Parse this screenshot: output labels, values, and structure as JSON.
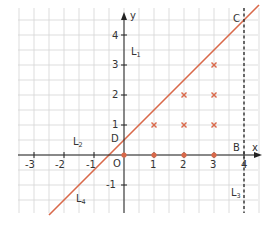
{
  "diagram": {
    "title": "",
    "axes": {
      "x_label": "x",
      "y_label": "y",
      "origin_label": "O",
      "x_ticks": [
        "-3",
        "-2",
        "-1",
        "1",
        "2",
        "3",
        "4"
      ],
      "y_ticks": [
        "-1",
        "1",
        "2",
        "3",
        "4"
      ]
    },
    "lines": [
      {
        "name": "L",
        "subscript": "1",
        "description": "y-axis"
      },
      {
        "name": "L",
        "subscript": "2",
        "description": "x-axis"
      },
      {
        "name": "L",
        "subscript": "3",
        "description": "x = 4 (dashed)"
      },
      {
        "name": "L",
        "subscript": "4",
        "description": "y = x + 0.5"
      }
    ],
    "points": {
      "B": "B",
      "C": "C",
      "D": "D"
    },
    "colors": {
      "grid": "#cfcfcf",
      "axis": "#222222",
      "line": "#d9694a",
      "marks": "#d9694a"
    }
  },
  "chart_data": {
    "type": "scatter",
    "title": "",
    "xlabel": "x",
    "ylabel": "y",
    "xlim": [
      -3.5,
      4.5
    ],
    "ylim": [
      -1.9,
      4.8
    ],
    "grid": true,
    "grid_step": 0.5,
    "series": [
      {
        "name": "lattice points (x marks)",
        "marker": "x",
        "points": [
          [
            1,
            1
          ],
          [
            2,
            1
          ],
          [
            3,
            1
          ],
          [
            2,
            2
          ],
          [
            3,
            2
          ],
          [
            3,
            3
          ]
        ]
      },
      {
        "name": "points on x-axis (dots)",
        "marker": "dot",
        "points": [
          [
            0,
            0
          ],
          [
            1,
            0
          ],
          [
            2,
            0
          ],
          [
            3,
            0
          ]
        ]
      },
      {
        "name": "L4",
        "kind": "line",
        "equation": "y = x + 0.5",
        "points": [
          [
            -2.5,
            -2
          ],
          [
            4.5,
            5
          ]
        ]
      },
      {
        "name": "L3",
        "kind": "dashed-line",
        "equation": "x = 4"
      }
    ],
    "annotations": [
      {
        "label": "B",
        "at": [
          4,
          0
        ]
      },
      {
        "label": "C",
        "at": [
          4,
          4.5
        ]
      },
      {
        "label": "D",
        "at": [
          0,
          0.5
        ]
      },
      {
        "label": "O",
        "at": [
          0,
          0
        ]
      },
      {
        "label": "L1",
        "at": [
          0,
          3.7
        ]
      },
      {
        "label": "L2",
        "at": [
          -2,
          0.4
        ]
      },
      {
        "label": "L3",
        "at": [
          4,
          -1
        ]
      },
      {
        "label": "L4",
        "at": [
          -1.7,
          -1.6
        ]
      }
    ]
  }
}
